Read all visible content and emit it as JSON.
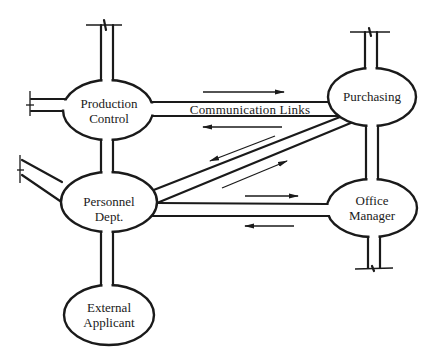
{
  "diagram": {
    "type": "communication-network",
    "nodes": [
      {
        "id": "production_control",
        "line1": "Production",
        "line2": "Control"
      },
      {
        "id": "purchasing",
        "line1": "Purchasing",
        "line2": ""
      },
      {
        "id": "personnel_dept",
        "line1": "Personnel",
        "line2": "Dept."
      },
      {
        "id": "office_manager",
        "line1": "Office",
        "line2": "Manager"
      },
      {
        "id": "external_applicant",
        "line1": "External",
        "line2": "Applicant"
      }
    ],
    "link_label": "Communication Links",
    "links": [
      {
        "from": "production_control",
        "to": "purchasing",
        "arrows": [
          "to-right",
          "to-left"
        ]
      },
      {
        "from": "personnel_dept",
        "to": "purchasing",
        "arrows": [
          "to-lower-left",
          "to-upper-right"
        ]
      },
      {
        "from": "personnel_dept",
        "to": "office_manager",
        "arrows": [
          "to-right",
          "to-left"
        ]
      },
      {
        "from": "production_control",
        "to": "personnel_dept",
        "arrows": []
      },
      {
        "from": "purchasing",
        "to": "office_manager",
        "arrows": []
      },
      {
        "from": "personnel_dept",
        "to": "external_applicant",
        "arrows": []
      }
    ],
    "colors": {
      "line": "#1a1a1a",
      "background": "#ffffff"
    }
  }
}
